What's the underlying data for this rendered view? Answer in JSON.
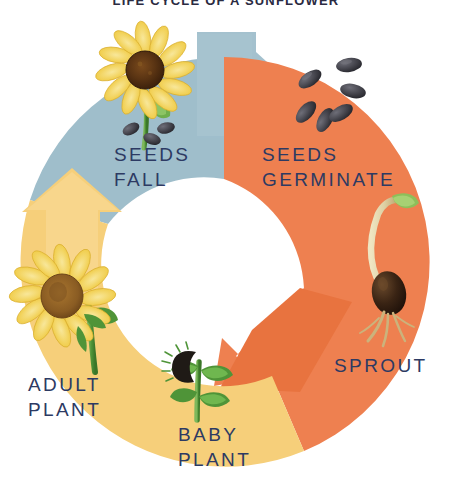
{
  "page": {
    "title": "LIFE CYCLE OF A SUNFLOWER",
    "background_color": "#ffffff",
    "width": 452,
    "height": 486
  },
  "diagram": {
    "kind": "circular-life-cycle",
    "direction": "clockwise",
    "center": {
      "x": 224,
      "y": 262
    },
    "outer_radius": 205,
    "inner_radius": 122,
    "label_color": "#2d3a63",
    "arcs": [
      {
        "name": "seeds-fall-arc",
        "color": "#9fbecb",
        "from_stage": "ADULT PLANT",
        "to_stage": "SEEDS FALL",
        "start_angle_deg": 188,
        "end_angle_deg": 352,
        "arrowhead": "right"
      },
      {
        "name": "seeds-germinate-arc",
        "color": "#ee8050",
        "from_stage": "SEEDS FALL",
        "to_stage": "SPROUT",
        "start_angle_deg": 290,
        "end_angle_deg": 118,
        "arrowhead": "down-left"
      },
      {
        "name": "growth-arc",
        "color": "#f6cf7a",
        "from_stage": "SPROUT",
        "to_stage": "ADULT PLANT",
        "start_angle_deg": 92,
        "end_angle_deg": 236,
        "arrowhead": "up"
      }
    ],
    "stages": [
      {
        "id": "seeds-fall",
        "label_lines": [
          "SEEDS",
          "FALL"
        ],
        "label": "SEEDS FALL",
        "illustration": "sunflower-head-dropping-seeds",
        "order": 1
      },
      {
        "id": "seeds-germinate",
        "label_lines": [
          "SEEDS",
          "GERMINATE"
        ],
        "label": "SEEDS GERMINATE",
        "illustration": "scattered-sunflower-seeds",
        "order": 2
      },
      {
        "id": "sprout",
        "label_lines": [
          "SPROUT"
        ],
        "label": "SPROUT",
        "illustration": "germinating-seed-with-root-and-shoot",
        "order": 3
      },
      {
        "id": "baby-plant",
        "label_lines": [
          "BABY",
          "PLANT"
        ],
        "label": "BABY PLANT",
        "illustration": "young-seedling-with-leaves",
        "order": 4
      },
      {
        "id": "adult-plant",
        "label_lines": [
          "ADULT",
          "PLANT"
        ],
        "label": "ADULT PLANT",
        "illustration": "mature-sunflower-bloom",
        "order": 5
      }
    ],
    "palette": {
      "blue_gray": "#9fbecb",
      "orange": "#ee8050",
      "yellow": "#f6cf7a",
      "navy_text": "#2d3a63",
      "petal_yellow": "#f2d24f",
      "petal_yellow_light": "#f7e08a",
      "flower_center_brown": "#8a5c23",
      "flower_center_dark": "#4a2a12",
      "stem_green": "#5f9e45",
      "leaf_green": "#4f9438",
      "seed_dark": "#3a3a40",
      "seed_highlight": "#6b6b74",
      "sprout_cream": "#ded0a4",
      "root_tan": "#c9b37e"
    }
  }
}
